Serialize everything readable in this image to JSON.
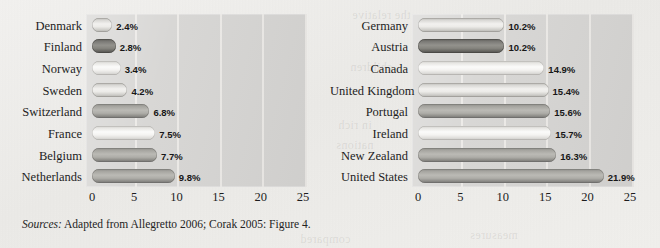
{
  "figure": {
    "source_note_label": "Sources:",
    "source_note_text": " Adapted from Allegretto 2006; Corak 2005: Figure 4."
  },
  "ghost_text": [
    {
      "text": "the relative",
      "x": 352,
      "y": 8
    },
    {
      "text": "poverty rates",
      "x": 470,
      "y": 10
    },
    {
      "text": "children",
      "x": 350,
      "y": 60
    },
    {
      "text": "in rich",
      "x": 338,
      "y": 118
    },
    {
      "text": "nations",
      "x": 336,
      "y": 138
    },
    {
      "text": "compared",
      "x": 300,
      "y": 232
    },
    {
      "text": "measures",
      "x": 470,
      "y": 228
    }
  ],
  "chart_data": [
    {
      "id": "left",
      "type": "bar",
      "orientation": "horizontal",
      "title": "",
      "xlabel": "",
      "ylabel": "",
      "xlim": [
        0,
        25
      ],
      "xticks": [
        "0",
        "5",
        "10",
        "15",
        "20",
        "25"
      ],
      "grid": true,
      "legend": "none",
      "value_suffix": "%",
      "categories": [
        "Denmark",
        "Finland",
        "Norway",
        "Sweden",
        "Switzerland",
        "France",
        "Belgium",
        "Netherlands"
      ],
      "values": [
        2.4,
        2.8,
        3.4,
        4.2,
        6.8,
        7.5,
        7.7,
        9.8
      ],
      "value_labels": [
        "2.4%",
        "2.8%",
        "3.4%",
        "4.2%",
        "6.8%",
        "7.5%",
        "7.7%",
        "9.8%"
      ],
      "bar_styles": [
        "bar-light",
        "bar-dark",
        "bar-pale",
        "bar-light",
        "bar-mid",
        "bar-pale",
        "bar-mid",
        "bar-mid"
      ]
    },
    {
      "id": "right",
      "type": "bar",
      "orientation": "horizontal",
      "title": "",
      "xlabel": "",
      "ylabel": "",
      "xlim": [
        0,
        25
      ],
      "xticks": [
        "0",
        "5",
        "10",
        "15",
        "20",
        "25"
      ],
      "grid": true,
      "legend": "none",
      "value_suffix": "%",
      "categories": [
        "Germany",
        "Austria",
        "Canada",
        "United Kingdom",
        "Portugal",
        "Ireland",
        "New Zealand",
        "United States"
      ],
      "values": [
        10.2,
        10.2,
        14.9,
        15.4,
        15.6,
        16.3,
        21.9
      ],
      "values_full": [
        10.2,
        10.2,
        14.9,
        15.4,
        15.6,
        15.7,
        16.3,
        21.9
      ],
      "value_labels": [
        "10.2%",
        "10.2%",
        "14.9%",
        "15.4%",
        "15.6%",
        "15.7%",
        "16.3%",
        "21.9%"
      ],
      "bar_styles": [
        "bar-light",
        "bar-dark",
        "bar-pale",
        "bar-light",
        "bar-mid",
        "bar-pale",
        "bar-mid",
        "bar-mid"
      ]
    }
  ],
  "colors": {
    "page_background": "#efeeec",
    "plot_background": "#d6d5d3",
    "gridline": "#eceae7",
    "text": "#1d1d1d"
  }
}
